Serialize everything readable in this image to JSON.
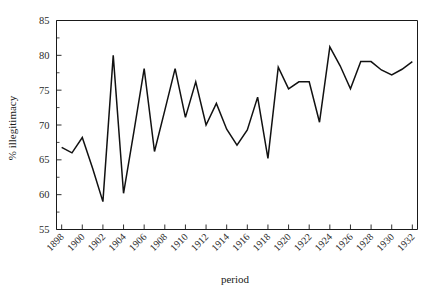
{
  "chart_data": {
    "type": "line",
    "title": "",
    "xlabel": "period",
    "ylabel": "% illegitimacy",
    "xlim": [
      1897.5,
      1932.5
    ],
    "ylim": [
      55,
      85
    ],
    "grid": false,
    "legend": false,
    "y_ticks": [
      55,
      60,
      65,
      70,
      75,
      80,
      85
    ],
    "y_minor_ticks": [
      57.5,
      62.5,
      67.5,
      72.5,
      77.5,
      82.5
    ],
    "x_ticks": [
      1898,
      1900,
      1902,
      1904,
      1906,
      1908,
      1910,
      1912,
      1914,
      1916,
      1918,
      1920,
      1922,
      1924,
      1926,
      1928,
      1930,
      1932
    ],
    "x_tick_labels": [
      "1898",
      "1900",
      "1902",
      "1904",
      "1906",
      "1908",
      "1910",
      "1912",
      "1914",
      "1916",
      "1918",
      "1920",
      "1922",
      "1924",
      "1926",
      "1928",
      "1930",
      "1932"
    ],
    "x": [
      1898,
      1899,
      1900,
      1901,
      1902,
      1903,
      1904,
      1905,
      1906,
      1907,
      1908,
      1909,
      1910,
      1911,
      1912,
      1913,
      1914,
      1915,
      1916,
      1917,
      1918,
      1919,
      1920,
      1921,
      1922,
      1923,
      1924,
      1925,
      1926,
      1927,
      1928,
      1929,
      1930,
      1931,
      1932
    ],
    "values": [
      66.8,
      66.0,
      68.2,
      63.8,
      59.0,
      80.0,
      60.2,
      69.0,
      78.1,
      66.2,
      72.1,
      78.1,
      71.1,
      76.2,
      70.0,
      73.1,
      69.4,
      67.1,
      69.3,
      74.0,
      65.2,
      78.3,
      75.2,
      76.2,
      76.2,
      70.4,
      81.2,
      78.5,
      75.2,
      79.1,
      79.1,
      77.9,
      77.2,
      78.0,
      79.1
    ],
    "series_name": "% illegitimacy",
    "line_color": "#111111"
  },
  "axes": {
    "y_axis_title": "% illegitimacy",
    "x_axis_title": "period"
  }
}
